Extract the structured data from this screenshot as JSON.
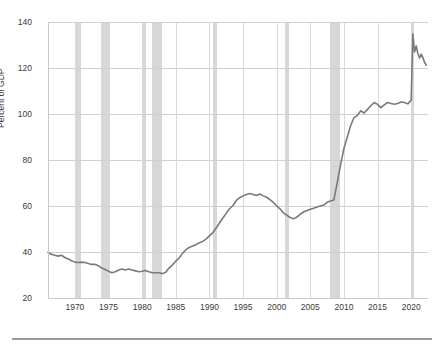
{
  "chart_data": {
    "type": "line",
    "title": "",
    "subtitle": "",
    "xlabel": "",
    "ylabel": "Percent of GDP",
    "xlim": [
      1966,
      2022.5
    ],
    "ylim": [
      20,
      140
    ],
    "grid": true,
    "legend": "none",
    "x_ticks": [
      "1970",
      "1975",
      "1980",
      "1985",
      "1990",
      "1995",
      "2000",
      "2005",
      "2010",
      "2015",
      "2020"
    ],
    "x_tick_values": [
      1970,
      1975,
      1980,
      1985,
      1990,
      1995,
      2000,
      2005,
      2010,
      2015,
      2020
    ],
    "y_ticks": [
      "20",
      "40",
      "60",
      "80",
      "100",
      "120",
      "140"
    ],
    "y_tick_values": [
      20,
      40,
      60,
      80,
      100,
      120,
      140
    ],
    "series": [
      {
        "name": "Federal debt held by the public",
        "color": "#7a7a7a",
        "x": [
          1966.0,
          1966.5,
          1967.0,
          1967.5,
          1968.0,
          1968.5,
          1969.0,
          1969.5,
          1970.0,
          1970.5,
          1971.0,
          1971.5,
          1972.0,
          1972.5,
          1973.0,
          1973.5,
          1974.0,
          1974.5,
          1975.0,
          1975.5,
          1976.0,
          1976.5,
          1977.0,
          1977.5,
          1978.0,
          1978.5,
          1979.0,
          1979.5,
          1980.0,
          1980.5,
          1981.0,
          1981.5,
          1982.0,
          1982.5,
          1983.0,
          1983.5,
          1984.0,
          1984.5,
          1985.0,
          1985.5,
          1986.0,
          1986.5,
          1987.0,
          1987.5,
          1988.0,
          1988.5,
          1989.0,
          1989.5,
          1990.0,
          1990.5,
          1991.0,
          1991.5,
          1992.0,
          1992.5,
          1993.0,
          1993.5,
          1994.0,
          1994.5,
          1995.0,
          1995.5,
          1996.0,
          1996.5,
          1997.0,
          1997.5,
          1998.0,
          1998.5,
          1999.0,
          1999.5,
          2000.0,
          2000.5,
          2001.0,
          2001.5,
          2002.0,
          2002.5,
          2003.0,
          2003.5,
          2004.0,
          2004.5,
          2005.0,
          2005.5,
          2006.0,
          2006.5,
          2007.0,
          2007.5,
          2008.0,
          2008.5,
          2009.0,
          2009.5,
          2010.0,
          2010.5,
          2011.0,
          2011.5,
          2012.0,
          2012.5,
          2013.0,
          2013.5,
          2014.0,
          2014.5,
          2015.0,
          2015.5,
          2016.0,
          2016.5,
          2017.0,
          2017.5,
          2018.0,
          2018.5,
          2019.0,
          2019.5,
          2020.0,
          2020.25,
          2020.5,
          2020.75,
          2021.0,
          2021.25,
          2021.5,
          2021.75,
          2022.0,
          2022.25
        ],
        "y": [
          39.8,
          39.0,
          38.6,
          38.2,
          38.6,
          37.6,
          37.0,
          36.2,
          35.6,
          35.4,
          35.6,
          35.4,
          35.0,
          34.6,
          34.6,
          34.0,
          33.0,
          32.4,
          31.6,
          31.0,
          31.4,
          32.2,
          32.6,
          32.2,
          32.6,
          32.2,
          31.8,
          31.4,
          31.6,
          32.0,
          31.4,
          31.0,
          31.0,
          31.0,
          30.6,
          31.2,
          33.0,
          34.4,
          36.0,
          37.4,
          39.4,
          41.0,
          42.0,
          42.6,
          43.2,
          44.0,
          44.6,
          45.6,
          47.0,
          48.4,
          50.4,
          52.6,
          54.8,
          56.8,
          58.8,
          60.2,
          62.4,
          63.6,
          64.4,
          65.0,
          65.4,
          65.0,
          64.6,
          65.2,
          64.4,
          63.8,
          62.8,
          61.6,
          60.0,
          58.8,
          57.0,
          56.0,
          55.0,
          54.4,
          55.2,
          56.4,
          57.4,
          58.0,
          58.6,
          59.0,
          59.6,
          60.0,
          60.4,
          61.6,
          62.2,
          62.6,
          70.0,
          78.0,
          85.0,
          90.0,
          95.0,
          98.4,
          99.4,
          101.4,
          100.4,
          102.0,
          103.6,
          105.0,
          104.2,
          102.8,
          104.0,
          105.0,
          104.6,
          104.2,
          104.6,
          105.2,
          105.0,
          104.4,
          106.0,
          134.8,
          127.0,
          129.6,
          126.2,
          124.4,
          126.0,
          124.4,
          122.4,
          121.2
        ]
      }
    ],
    "recession_bands": [
      {
        "start": 1969.95,
        "end": 1970.9
      },
      {
        "start": 1973.9,
        "end": 1975.2
      },
      {
        "start": 1980.05,
        "end": 1980.6
      },
      {
        "start": 1981.5,
        "end": 1982.9
      },
      {
        "start": 1990.55,
        "end": 1991.2
      },
      {
        "start": 2001.2,
        "end": 2001.9
      },
      {
        "start": 2007.95,
        "end": 2009.45
      },
      {
        "start": 2020.1,
        "end": 2020.35
      }
    ],
    "colors": {
      "line": "#7a7a7a",
      "recession_band": "#d7d7d7",
      "gridline": "#d0d0d0",
      "axis": "#c9c9c9",
      "tick_label": "#3a3a3a",
      "background": "#ffffff",
      "footer_rule": "#9a9a9a"
    }
  }
}
